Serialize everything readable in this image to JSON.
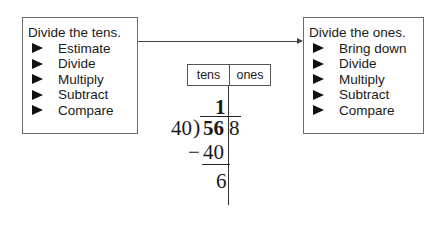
{
  "left_box": {
    "title": "Divide the tens.",
    "steps": [
      "Estimate",
      "Divide",
      "Multiply",
      "Subtract",
      "Compare"
    ],
    "bullet_icon": "right-triangle-bullet"
  },
  "right_box": {
    "title": "Divide the ones.",
    "steps": [
      "Bring down",
      "Divide",
      "Multiply",
      "Subtract",
      "Compare"
    ],
    "bullet_icon": "right-triangle-bullet"
  },
  "place_value_header": {
    "tens": "tens",
    "ones": "ones"
  },
  "long_division": {
    "quotient": "1",
    "divisor": "40",
    "bracket": ")",
    "dividend_tens_part": "56",
    "dividend_ones_part": "8",
    "minus": "−",
    "subtrahend": "40",
    "remainder": "6"
  },
  "colors": {
    "box_border": "#6b6b6b",
    "text": "#1a1a1a",
    "background": "#ffffff"
  }
}
